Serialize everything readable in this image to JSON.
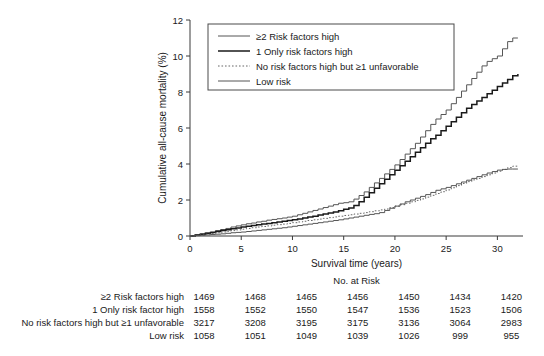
{
  "chart_data": {
    "type": "line",
    "title": "",
    "xlabel": "Survival time (years)",
    "ylabel": "Cumulative all-cause mortality (%)",
    "xlim": [
      0,
      32.5
    ],
    "ylim": [
      0,
      12
    ],
    "xticks": [
      0,
      5,
      10,
      15,
      20,
      25,
      30
    ],
    "yticks": [
      0,
      2,
      4,
      6,
      8,
      10,
      12
    ],
    "grid": false,
    "legend_position": "top-center",
    "series": [
      {
        "name": "≥2 Risk factors high",
        "style": "solid",
        "x": [
          0,
          0.5,
          1,
          1.5,
          2,
          2.5,
          3,
          3.5,
          4,
          4.5,
          5,
          5.5,
          6,
          6.5,
          7,
          7.5,
          8,
          8.5,
          9,
          9.5,
          10,
          10.5,
          11,
          11.5,
          12,
          12.5,
          13,
          13.5,
          14,
          14.5,
          15,
          15.5,
          16,
          16.5,
          17,
          17.5,
          18,
          18.5,
          19,
          19.5,
          20,
          20.5,
          21,
          21.5,
          22,
          22.5,
          23,
          23.5,
          24,
          24.5,
          25,
          25.5,
          26,
          26.5,
          27,
          27.5,
          28,
          28.5,
          29,
          29.5,
          30,
          30.5,
          31,
          31.5,
          32
        ],
        "y": [
          0,
          0.06,
          0.12,
          0.17,
          0.22,
          0.3,
          0.36,
          0.42,
          0.5,
          0.56,
          0.62,
          0.68,
          0.72,
          0.78,
          0.82,
          0.88,
          0.92,
          0.96,
          1.0,
          1.05,
          1.1,
          1.18,
          1.26,
          1.34,
          1.42,
          1.5,
          1.58,
          1.66,
          1.74,
          1.82,
          1.85,
          1.9,
          2.05,
          2.25,
          2.45,
          2.7,
          2.95,
          3.2,
          3.45,
          3.7,
          3.95,
          4.25,
          4.55,
          4.85,
          5.15,
          5.5,
          5.85,
          6.2,
          6.5,
          6.75,
          7.0,
          7.35,
          7.7,
          8.05,
          8.4,
          8.75,
          9.1,
          9.45,
          9.7,
          9.85,
          10.0,
          10.4,
          10.8,
          11.0,
          11.0
        ]
      },
      {
        "name": "1 Only risk factors high",
        "style": "solid",
        "x": [
          0,
          0.5,
          1,
          1.5,
          2,
          2.5,
          3,
          3.5,
          4,
          4.5,
          5,
          5.5,
          6,
          6.5,
          7,
          7.5,
          8,
          8.5,
          9,
          9.5,
          10,
          10.5,
          11,
          11.5,
          12,
          12.5,
          13,
          13.5,
          14,
          14.5,
          15,
          15.5,
          16,
          16.5,
          17,
          17.5,
          18,
          18.5,
          19,
          19.5,
          20,
          20.5,
          21,
          21.5,
          22,
          22.5,
          23,
          23.5,
          24,
          24.5,
          25,
          25.5,
          26,
          26.5,
          27,
          27.5,
          28,
          28.5,
          29,
          29.5,
          30,
          30.5,
          31,
          31.5,
          32
        ],
        "y": [
          0,
          0.05,
          0.1,
          0.15,
          0.2,
          0.25,
          0.3,
          0.35,
          0.4,
          0.45,
          0.5,
          0.54,
          0.58,
          0.62,
          0.66,
          0.7,
          0.74,
          0.78,
          0.82,
          0.86,
          0.9,
          0.95,
          1.0,
          1.05,
          1.1,
          1.16,
          1.22,
          1.28,
          1.34,
          1.4,
          1.48,
          1.56,
          1.7,
          1.9,
          2.15,
          2.4,
          2.65,
          2.9,
          3.15,
          3.4,
          3.65,
          3.9,
          4.15,
          4.4,
          4.65,
          4.9,
          5.15,
          5.4,
          5.6,
          5.85,
          6.1,
          6.35,
          6.6,
          6.85,
          7.1,
          7.3,
          7.5,
          7.7,
          7.9,
          8.1,
          8.3,
          8.5,
          8.7,
          8.9,
          9.0
        ]
      },
      {
        "name": "No risk factors high but ≥1 unfavorable",
        "style": "dotted",
        "x": [
          0,
          0.5,
          1,
          1.5,
          2,
          2.5,
          3,
          3.5,
          4,
          4.5,
          5,
          5.5,
          6,
          6.5,
          7,
          7.5,
          8,
          8.5,
          9,
          9.5,
          10,
          10.5,
          11,
          11.5,
          12,
          12.5,
          13,
          13.5,
          14,
          14.5,
          15,
          15.5,
          16,
          16.5,
          17,
          17.5,
          18,
          18.5,
          19,
          19.5,
          20,
          20.5,
          21,
          21.5,
          22,
          22.5,
          23,
          23.5,
          24,
          24.5,
          25,
          25.5,
          26,
          26.5,
          27,
          27.5,
          28,
          28.5,
          29,
          29.5,
          30,
          30.5,
          31,
          31.5,
          32
        ],
        "y": [
          0,
          0.03,
          0.06,
          0.1,
          0.14,
          0.18,
          0.22,
          0.26,
          0.3,
          0.34,
          0.38,
          0.42,
          0.46,
          0.5,
          0.53,
          0.56,
          0.6,
          0.63,
          0.66,
          0.7,
          0.74,
          0.78,
          0.82,
          0.86,
          0.9,
          0.94,
          0.98,
          1.02,
          1.06,
          1.1,
          1.14,
          1.18,
          1.22,
          1.26,
          1.3,
          1.35,
          1.4,
          1.45,
          1.5,
          1.58,
          1.66,
          1.74,
          1.82,
          1.9,
          1.98,
          2.06,
          2.16,
          2.26,
          2.36,
          2.46,
          2.56,
          2.68,
          2.8,
          2.92,
          3.02,
          3.12,
          3.2,
          3.3,
          3.4,
          3.5,
          3.6,
          3.7,
          3.8,
          3.88,
          3.9
        ]
      },
      {
        "name": "Low risk",
        "style": "solid",
        "x": [
          0,
          0.5,
          1,
          1.5,
          2,
          2.5,
          3,
          3.5,
          4,
          4.5,
          5,
          5.5,
          6,
          6.5,
          7,
          7.5,
          8,
          8.5,
          9,
          9.5,
          10,
          10.5,
          11,
          11.5,
          12,
          12.5,
          13,
          13.5,
          14,
          14.5,
          15,
          15.5,
          16,
          16.5,
          17,
          17.5,
          18,
          18.5,
          19,
          19.5,
          20,
          20.5,
          21,
          21.5,
          22,
          22.5,
          23,
          23.5,
          24,
          24.5,
          25,
          25.5,
          26,
          26.5,
          27,
          27.5,
          28,
          28.5,
          29,
          29.5,
          30,
          30.5,
          31,
          31.5,
          32
        ],
        "y": [
          0,
          0.02,
          0.04,
          0.06,
          0.08,
          0.1,
          0.12,
          0.15,
          0.18,
          0.2,
          0.22,
          0.25,
          0.28,
          0.31,
          0.34,
          0.37,
          0.4,
          0.43,
          0.46,
          0.5,
          0.54,
          0.58,
          0.62,
          0.66,
          0.7,
          0.74,
          0.78,
          0.82,
          0.86,
          0.9,
          0.95,
          1.0,
          1.05,
          1.1,
          1.15,
          1.2,
          1.24,
          1.3,
          1.42,
          1.54,
          1.66,
          1.78,
          1.9,
          2.0,
          2.1,
          2.2,
          2.3,
          2.42,
          2.54,
          2.62,
          2.7,
          2.8,
          2.9,
          3.0,
          3.1,
          3.2,
          3.3,
          3.4,
          3.5,
          3.58,
          3.66,
          3.7,
          3.72,
          3.72,
          3.72
        ]
      }
    ]
  },
  "legend": {
    "entries": [
      {
        "label": "≥2 Risk factors high",
        "style": "solid"
      },
      {
        "label": "1 Only risk factors high",
        "style": "solid"
      },
      {
        "label": "No risk factors high but ≥1 unfavorable",
        "style": "dotted"
      },
      {
        "label": "Low risk",
        "style": "solid"
      }
    ]
  },
  "risk_table": {
    "title": "No. at Risk",
    "times": [
      0,
      5,
      10,
      15,
      20,
      25,
      30
    ],
    "rows": [
      {
        "label": "≥2 Risk factors high",
        "values": [
          1469,
          1468,
          1465,
          1456,
          1450,
          1434,
          1420
        ]
      },
      {
        "label": "1 Only risk factor high",
        "values": [
          1558,
          1552,
          1550,
          1547,
          1536,
          1523,
          1506
        ]
      },
      {
        "label": "No risk factors high but ≥1 unfavorable",
        "values": [
          3217,
          3208,
          3195,
          3175,
          3136,
          3064,
          2983
        ]
      },
      {
        "label": "Low risk",
        "values": [
          1058,
          1051,
          1049,
          1039,
          1026,
          999,
          955
        ]
      }
    ]
  }
}
